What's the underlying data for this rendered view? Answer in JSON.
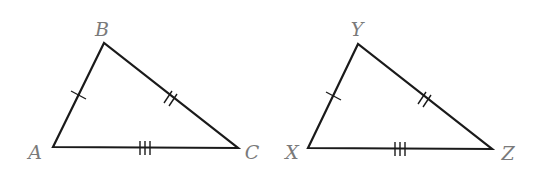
{
  "diagram": {
    "colors": {
      "line": "#1a1a1a",
      "label": "#7a7a7a",
      "background": "#ffffff"
    },
    "triangles": [
      {
        "name": "ABC",
        "vertices": {
          "A": {
            "label": "A",
            "x": 53,
            "y": 147,
            "lx": 35,
            "ly": 152
          },
          "B": {
            "label": "B",
            "x": 104,
            "y": 43,
            "lx": 102,
            "ly": 29
          },
          "C": {
            "label": "C",
            "x": 238,
            "y": 148,
            "lx": 252,
            "ly": 152
          }
        },
        "sides": [
          {
            "name": "AB",
            "ticks": 1
          },
          {
            "name": "BC",
            "ticks": 2
          },
          {
            "name": "AC",
            "ticks": 3
          }
        ]
      },
      {
        "name": "XYZ",
        "vertices": {
          "X": {
            "label": "X",
            "x": 308,
            "y": 148,
            "lx": 292,
            "ly": 152
          },
          "Y": {
            "label": "Y",
            "x": 358,
            "y": 44,
            "lx": 357,
            "ly": 29
          },
          "Z": {
            "label": "Z",
            "x": 492,
            "y": 149,
            "lx": 508,
            "ly": 153
          }
        },
        "sides": [
          {
            "name": "XY",
            "ticks": 1
          },
          {
            "name": "YZ",
            "ticks": 2
          },
          {
            "name": "XZ",
            "ticks": 3
          }
        ]
      }
    ]
  }
}
